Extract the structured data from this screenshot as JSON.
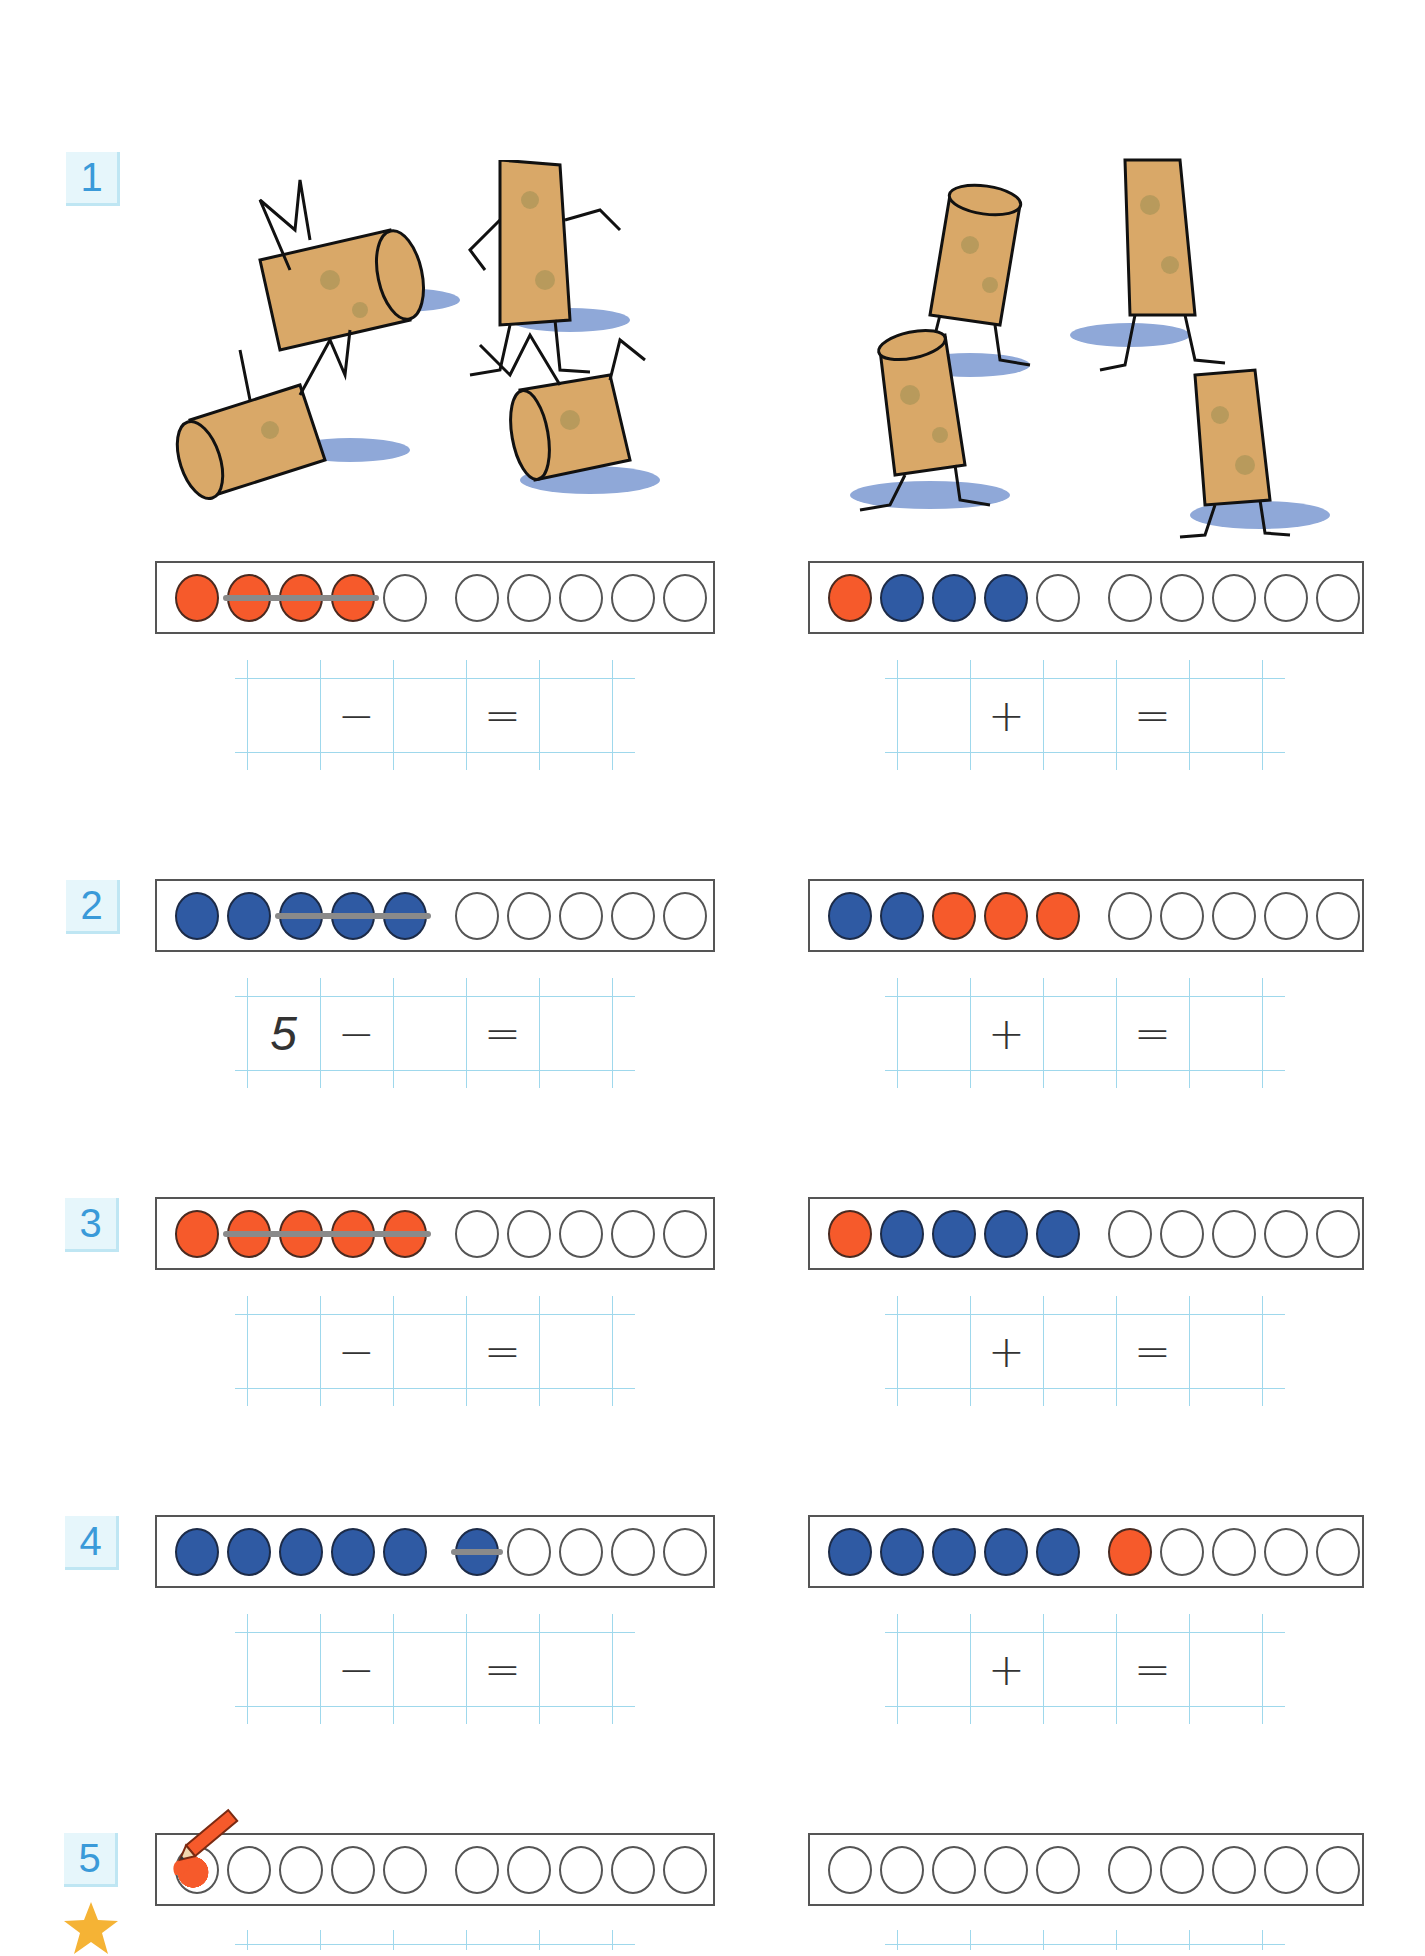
{
  "colors": {
    "red": "#f65a2b",
    "blue": "#2f5aa3",
    "label_text": "#3a9ad9",
    "label_bg": "#e6f6fb",
    "grid_line": "#9fd8ec",
    "strike": "#8a8a8a",
    "star": "#f5b335"
  },
  "exercises": [
    {
      "number": "1",
      "left": {
        "illustration": "four-corks-falling-over",
        "frame": [
          "red",
          "red",
          "red",
          "red",
          "empty",
          "empty",
          "empty",
          "empty",
          "empty",
          "empty"
        ],
        "crossed_out": [
          2,
          4
        ],
        "equation": [
          "",
          "−",
          "",
          "=",
          ""
        ]
      },
      "right": {
        "illustration": "four-corks-standing",
        "frame": [
          "red",
          "blue",
          "blue",
          "blue",
          "empty",
          "empty",
          "empty",
          "empty",
          "empty",
          "empty"
        ],
        "crossed_out": null,
        "equation": [
          "",
          "+",
          "",
          "=",
          ""
        ]
      }
    },
    {
      "number": "2",
      "left": {
        "frame": [
          "blue",
          "blue",
          "blue",
          "blue",
          "blue",
          "empty",
          "empty",
          "empty",
          "empty",
          "empty"
        ],
        "crossed_out": [
          3,
          5
        ],
        "equation": [
          "5",
          "−",
          "",
          "=",
          ""
        ]
      },
      "right": {
        "frame": [
          "blue",
          "blue",
          "red",
          "red",
          "red",
          "empty",
          "empty",
          "empty",
          "empty",
          "empty"
        ],
        "crossed_out": null,
        "equation": [
          "",
          "+",
          "",
          "=",
          ""
        ]
      }
    },
    {
      "number": "3",
      "left": {
        "frame": [
          "red",
          "red",
          "red",
          "red",
          "red",
          "empty",
          "empty",
          "empty",
          "empty",
          "empty"
        ],
        "crossed_out": [
          2,
          5
        ],
        "equation": [
          "",
          "−",
          "",
          "=",
          ""
        ]
      },
      "right": {
        "frame": [
          "red",
          "blue",
          "blue",
          "blue",
          "blue",
          "empty",
          "empty",
          "empty",
          "empty",
          "empty"
        ],
        "crossed_out": null,
        "equation": [
          "",
          "+",
          "",
          "=",
          ""
        ]
      }
    },
    {
      "number": "4",
      "left": {
        "frame": [
          "blue",
          "blue",
          "blue",
          "blue",
          "blue",
          "blue",
          "empty",
          "empty",
          "empty",
          "empty"
        ],
        "crossed_out": [
          6,
          6
        ],
        "equation": [
          "",
          "−",
          "",
          "=",
          ""
        ]
      },
      "right": {
        "frame": [
          "blue",
          "blue",
          "blue",
          "blue",
          "blue",
          "red",
          "empty",
          "empty",
          "empty",
          "empty"
        ],
        "crossed_out": null,
        "equation": [
          "",
          "+",
          "",
          "=",
          ""
        ]
      }
    },
    {
      "number": "5",
      "star": true,
      "left": {
        "frame": [
          "red-partial",
          "empty",
          "empty",
          "empty",
          "empty",
          "empty",
          "empty",
          "empty",
          "empty",
          "empty"
        ],
        "pencil": true
      },
      "right": {
        "frame": [
          "empty",
          "empty",
          "empty",
          "empty",
          "empty",
          "empty",
          "empty",
          "empty",
          "empty",
          "empty"
        ]
      }
    }
  ]
}
